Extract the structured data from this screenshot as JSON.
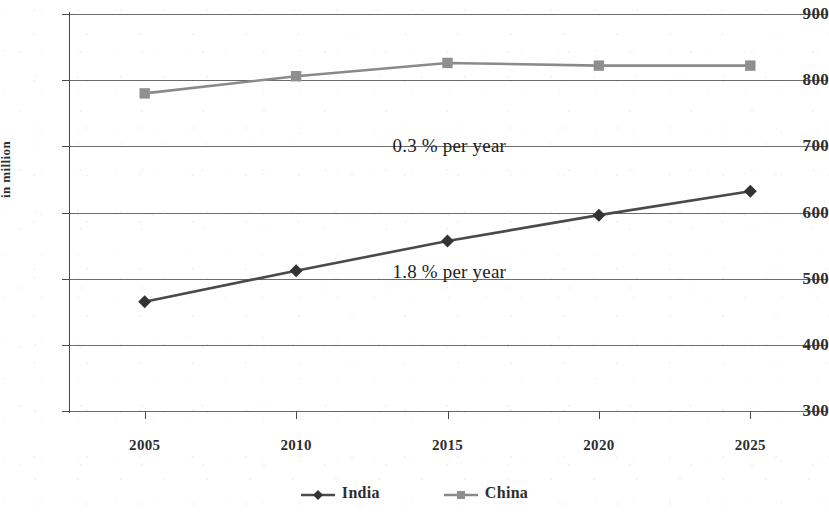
{
  "chart_data": {
    "type": "line",
    "title": "",
    "xlabel": "",
    "ylabel": "in million",
    "categories": [
      "2005",
      "2010",
      "2015",
      "2020",
      "2025"
    ],
    "x": [
      2005,
      2010,
      2015,
      2020,
      2025
    ],
    "xlim": [
      2002.5,
      2027.5
    ],
    "ylim": [
      300,
      900
    ],
    "ytick_labels": [
      "900",
      "800",
      "700",
      "600",
      "500",
      "400",
      "300"
    ],
    "yticks": [
      900,
      800,
      700,
      600,
      500,
      400,
      300
    ],
    "grid": "horizontal",
    "legend_position": "bottom",
    "series": [
      {
        "name": "India",
        "marker": "diamond",
        "color": "#4a4a4a",
        "values": [
          465,
          512,
          557,
          596,
          632
        ]
      },
      {
        "name": "China",
        "marker": "square",
        "color": "#8a8a8a",
        "values": [
          780,
          806,
          826,
          822,
          822
        ]
      }
    ],
    "annotations": [
      {
        "text": "0.3 % per year",
        "x": 2015,
        "y": 700
      },
      {
        "text": "1.8 % per year",
        "x": 2015,
        "y": 510
      }
    ]
  },
  "legend": {
    "entries": [
      {
        "label": "India",
        "marker": "diamond-marker-icon"
      },
      {
        "label": "China",
        "marker": "square-marker-icon"
      }
    ]
  },
  "colors": {
    "india": "#4a4a4a",
    "china": "#8a8a8a",
    "grid": "#6b6b6b",
    "axis": "#4a4a4a",
    "text": "#2e2e2e",
    "background": "#ffffff"
  }
}
